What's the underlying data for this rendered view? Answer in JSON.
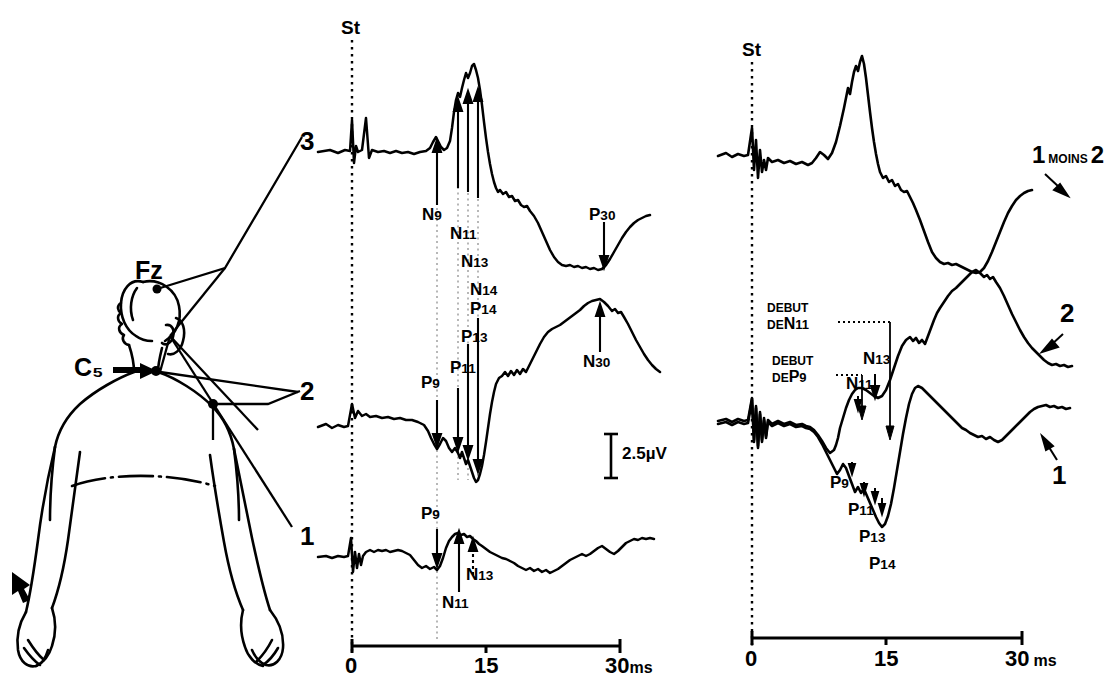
{
  "figure": {
    "scale_bar": "2.5µV",
    "stim_marker": "St"
  },
  "body_diagram": {
    "electrode_fz": "Fz",
    "electrode_c5": "C₅"
  },
  "left_panel": {
    "stim_label": "St",
    "trace_labels": [
      "3",
      "2",
      "1"
    ],
    "axis": {
      "ticks": [
        "0",
        "15",
        "30"
      ],
      "unit": "ms",
      "tick_unit_combined": "30ms"
    },
    "scale_bar_label": "2.5µV",
    "annotations_trace3": [
      {
        "name": "N9",
        "base": "N",
        "sub": "9"
      },
      {
        "name": "N11",
        "base": "N",
        "sub": "11"
      },
      {
        "name": "N13",
        "base": "N",
        "sub": "13"
      },
      {
        "name": "N14",
        "base": "N",
        "sub": "14"
      },
      {
        "name": "P30",
        "base": "P",
        "sub": "30"
      }
    ],
    "annotations_trace2": [
      {
        "name": "P14",
        "base": "P",
        "sub": "14"
      },
      {
        "name": "P13",
        "base": "P",
        "sub": "13"
      },
      {
        "name": "P11",
        "base": "P",
        "sub": "11"
      },
      {
        "name": "P9",
        "base": "P",
        "sub": "9"
      },
      {
        "name": "N30",
        "base": "N",
        "sub": "30"
      }
    ],
    "annotations_trace1": [
      {
        "name": "P9",
        "base": "P",
        "sub": "9"
      },
      {
        "name": "N13",
        "base": "N",
        "sub": "13"
      },
      {
        "name": "N11",
        "base": "N",
        "sub": "11"
      }
    ]
  },
  "right_panel": {
    "stim_label": "St",
    "trace_labels": [
      {
        "prefix": "1",
        "middle": "MOINS",
        "suffix": "2"
      },
      {
        "prefix": "2"
      },
      {
        "prefix": "1"
      }
    ],
    "axis": {
      "ticks": [
        "0",
        "15",
        "30"
      ],
      "unit": "ms"
    },
    "onset_markers": [
      {
        "line1": "DEBUT",
        "line2_prefix": "DE",
        "line2_peak_base": "N",
        "line2_peak_sub": "11"
      },
      {
        "line1": "DEBUT",
        "line2_prefix": "DE",
        "line2_peak_base": "P",
        "line2_peak_sub": "9"
      }
    ],
    "annotations": [
      {
        "name": "N13",
        "base": "N",
        "sub": "13"
      },
      {
        "name": "N11",
        "base": "N",
        "sub": "11"
      },
      {
        "name": "P9",
        "base": "P",
        "sub": "9"
      },
      {
        "name": "P11",
        "base": "P",
        "sub": "11"
      },
      {
        "name": "P13",
        "base": "P",
        "sub": "13"
      },
      {
        "name": "P14",
        "base": "P",
        "sub": "14"
      }
    ]
  },
  "colors": {
    "ink": "#000000",
    "background": "#ffffff"
  }
}
